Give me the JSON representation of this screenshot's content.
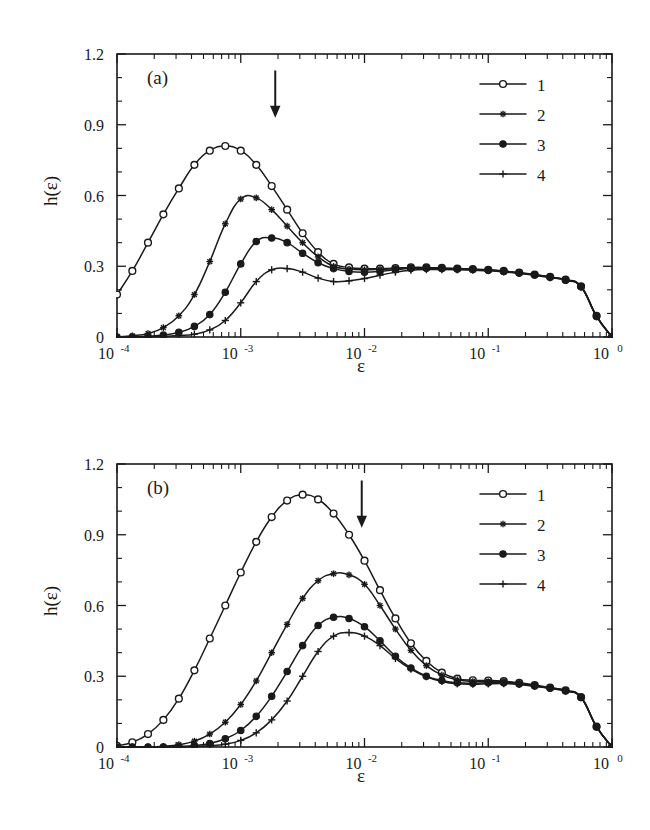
{
  "figure": {
    "background": "#ffffff",
    "ink_color": "#1a1a1a",
    "panels": [
      "a",
      "b"
    ]
  },
  "panel_a": {
    "tag": "(a)",
    "ylabel": "h(ε)",
    "xlabel": "ε",
    "arrow_x": 0.0019,
    "legend_entries": [
      "1",
      "2",
      "3",
      "4"
    ]
  },
  "panel_b": {
    "tag": "(b)",
    "ylabel": "h(ε)",
    "xlabel": "ε",
    "arrow_x": 0.0095,
    "legend_entries": [
      "1",
      "2",
      "3",
      "4"
    ]
  },
  "axes": {
    "y_ticks": [
      "0",
      "0.3",
      "0.6",
      "0.9",
      "1.2"
    ],
    "y_tick_values": [
      0,
      0.3,
      0.6,
      0.9,
      1.2
    ],
    "ylim": [
      0,
      1.2
    ],
    "x_tick_mantissa": [
      "10",
      "10",
      "10",
      "10",
      "10"
    ],
    "x_tick_exponents": [
      "-4",
      "-3",
      "-2",
      "-1",
      "0"
    ],
    "x_tick_values": [
      0.0001,
      0.001,
      0.01,
      0.1,
      1
    ],
    "xlim": [
      0.0001,
      1
    ],
    "x_scale": "log",
    "grid": false
  },
  "chart_data": [
    {
      "type": "line",
      "panel": "a",
      "title": "(a)",
      "xlabel": "ε",
      "ylabel": "h(ε)",
      "xscale": "log",
      "xlim": [
        0.0001,
        1
      ],
      "ylim": [
        0,
        1.2
      ],
      "grid": false,
      "legend_position": "top-right",
      "annotations": [
        {
          "type": "arrow",
          "x": 0.0019,
          "y_from": 1.13,
          "y_to": 0.93,
          "direction": "down"
        }
      ],
      "series": [
        {
          "name": "1",
          "marker": "open-circle",
          "x": [
            0.0001,
            0.000133,
            0.000178,
            0.000237,
            0.000316,
            0.000422,
            0.000562,
            0.00075,
            0.001,
            0.001334,
            0.001778,
            0.002371,
            0.003162,
            0.004217,
            0.005623,
            0.0075,
            0.01,
            0.01334,
            0.01778,
            0.02371,
            0.03162,
            0.04217,
            0.05623,
            0.075,
            0.1,
            0.1334,
            0.1778,
            0.2371,
            0.3162,
            0.4217,
            0.5623,
            0.75,
            1.0
          ],
          "y": [
            0.18,
            0.28,
            0.4,
            0.52,
            0.63,
            0.73,
            0.79,
            0.81,
            0.79,
            0.73,
            0.64,
            0.54,
            0.44,
            0.36,
            0.31,
            0.295,
            0.29,
            0.29,
            0.292,
            0.295,
            0.295,
            0.293,
            0.29,
            0.288,
            0.285,
            0.28,
            0.273,
            0.265,
            0.255,
            0.243,
            0.215,
            0.09,
            0.0
          ]
        },
        {
          "name": "2",
          "marker": "asterisk",
          "x": [
            0.0001,
            0.000133,
            0.000178,
            0.000237,
            0.000316,
            0.000422,
            0.000562,
            0.00075,
            0.001,
            0.001334,
            0.001778,
            0.002371,
            0.003162,
            0.004217,
            0.005623,
            0.0075,
            0.01,
            0.01334,
            0.01778,
            0.02371,
            0.03162,
            0.04217,
            0.05623,
            0.075,
            0.1,
            0.1334,
            0.1778,
            0.2371,
            0.3162,
            0.4217,
            0.5623,
            0.75,
            1.0
          ],
          "y": [
            0.0,
            0.005,
            0.015,
            0.04,
            0.09,
            0.18,
            0.32,
            0.48,
            0.585,
            0.59,
            0.54,
            0.47,
            0.4,
            0.34,
            0.3,
            0.288,
            0.285,
            0.287,
            0.29,
            0.293,
            0.293,
            0.291,
            0.289,
            0.287,
            0.284,
            0.279,
            0.272,
            0.264,
            0.254,
            0.242,
            0.214,
            0.088,
            0.0
          ]
        },
        {
          "name": "3",
          "marker": "filled-circle",
          "x": [
            0.0001,
            0.000133,
            0.000178,
            0.000237,
            0.000316,
            0.000422,
            0.000562,
            0.00075,
            0.001,
            0.001334,
            0.001778,
            0.002371,
            0.003162,
            0.004217,
            0.005623,
            0.0075,
            0.01,
            0.01334,
            0.01778,
            0.02371,
            0.03162,
            0.04217,
            0.05623,
            0.075,
            0.1,
            0.1334,
            0.1778,
            0.2371,
            0.3162,
            0.4217,
            0.5623,
            0.75,
            1.0
          ],
          "y": [
            0.0,
            0.0,
            0.003,
            0.008,
            0.02,
            0.045,
            0.095,
            0.19,
            0.31,
            0.405,
            0.42,
            0.4,
            0.355,
            0.315,
            0.29,
            0.278,
            0.275,
            0.278,
            0.285,
            0.29,
            0.291,
            0.29,
            0.288,
            0.286,
            0.283,
            0.278,
            0.271,
            0.263,
            0.253,
            0.241,
            0.213,
            0.087,
            0.0
          ]
        },
        {
          "name": "4",
          "marker": "plus",
          "x": [
            0.0001,
            0.000133,
            0.000178,
            0.000237,
            0.000316,
            0.000422,
            0.000562,
            0.00075,
            0.001,
            0.001334,
            0.001778,
            0.002371,
            0.003162,
            0.004217,
            0.005623,
            0.0075,
            0.01,
            0.01334,
            0.01778,
            0.02371,
            0.03162,
            0.04217,
            0.05623,
            0.075,
            0.1,
            0.1334,
            0.1778,
            0.2371,
            0.3162,
            0.4217,
            0.5623,
            0.75,
            1.0
          ],
          "y": [
            0.0,
            0.0,
            0.0,
            0.002,
            0.006,
            0.012,
            0.03,
            0.07,
            0.145,
            0.235,
            0.285,
            0.29,
            0.275,
            0.25,
            0.235,
            0.238,
            0.248,
            0.262,
            0.275,
            0.283,
            0.286,
            0.286,
            0.285,
            0.283,
            0.281,
            0.276,
            0.27,
            0.262,
            0.252,
            0.24,
            0.212,
            0.086,
            0.0
          ]
        }
      ]
    },
    {
      "type": "line",
      "panel": "b",
      "title": "(b)",
      "xlabel": "ε",
      "ylabel": "h(ε)",
      "xscale": "log",
      "xlim": [
        0.0001,
        1
      ],
      "ylim": [
        0,
        1.2
      ],
      "grid": false,
      "legend_position": "top-right",
      "annotations": [
        {
          "type": "arrow",
          "x": 0.0095,
          "y_from": 1.13,
          "y_to": 0.93,
          "direction": "down"
        }
      ],
      "series": [
        {
          "name": "1",
          "marker": "open-circle",
          "x": [
            0.0001,
            0.000133,
            0.000178,
            0.000237,
            0.000316,
            0.000422,
            0.000562,
            0.00075,
            0.001,
            0.001334,
            0.001778,
            0.002371,
            0.003162,
            0.004217,
            0.005623,
            0.0075,
            0.01,
            0.01334,
            0.01778,
            0.02371,
            0.03162,
            0.04217,
            0.05623,
            0.075,
            0.1,
            0.1334,
            0.1778,
            0.2371,
            0.3162,
            0.4217,
            0.5623,
            0.75,
            1.0
          ],
          "y": [
            0.005,
            0.02,
            0.055,
            0.115,
            0.205,
            0.325,
            0.46,
            0.6,
            0.74,
            0.87,
            0.975,
            1.045,
            1.07,
            1.05,
            0.99,
            0.9,
            0.79,
            0.665,
            0.545,
            0.44,
            0.365,
            0.315,
            0.29,
            0.283,
            0.282,
            0.279,
            0.272,
            0.263,
            0.252,
            0.24,
            0.212,
            0.087,
            0.0
          ]
        },
        {
          "name": "2",
          "marker": "asterisk",
          "x": [
            0.0001,
            0.000133,
            0.000178,
            0.000237,
            0.000316,
            0.000422,
            0.000562,
            0.00075,
            0.001,
            0.001334,
            0.001778,
            0.002371,
            0.003162,
            0.004217,
            0.005623,
            0.0075,
            0.01,
            0.01334,
            0.01778,
            0.02371,
            0.03162,
            0.04217,
            0.05623,
            0.075,
            0.1,
            0.1334,
            0.1778,
            0.2371,
            0.3162,
            0.4217,
            0.5623,
            0.75,
            1.0
          ],
          "y": [
            0.0,
            0.0,
            0.0,
            0.003,
            0.01,
            0.025,
            0.055,
            0.105,
            0.18,
            0.28,
            0.4,
            0.52,
            0.63,
            0.705,
            0.735,
            0.73,
            0.69,
            0.6,
            0.5,
            0.41,
            0.345,
            0.305,
            0.285,
            0.278,
            0.278,
            0.276,
            0.27,
            0.261,
            0.251,
            0.239,
            0.211,
            0.086,
            0.0
          ]
        },
        {
          "name": "3",
          "marker": "filled-circle",
          "x": [
            0.0001,
            0.000133,
            0.000178,
            0.000237,
            0.000316,
            0.000422,
            0.000562,
            0.00075,
            0.001,
            0.001334,
            0.001778,
            0.002371,
            0.003162,
            0.004217,
            0.005623,
            0.0075,
            0.01,
            0.01334,
            0.01778,
            0.02371,
            0.03162,
            0.04217,
            0.05623,
            0.075,
            0.1,
            0.1334,
            0.1778,
            0.2371,
            0.3162,
            0.4217,
            0.5623,
            0.75,
            1.0
          ],
          "y": [
            0.0,
            0.0,
            0.0,
            0.0,
            0.002,
            0.006,
            0.015,
            0.035,
            0.07,
            0.13,
            0.215,
            0.32,
            0.43,
            0.515,
            0.55,
            0.545,
            0.51,
            0.45,
            0.385,
            0.335,
            0.3,
            0.282,
            0.272,
            0.27,
            0.272,
            0.272,
            0.267,
            0.259,
            0.249,
            0.238,
            0.21,
            0.085,
            0.0
          ]
        },
        {
          "name": "4",
          "marker": "plus",
          "x": [
            0.0001,
            0.000133,
            0.000178,
            0.000237,
            0.000316,
            0.000422,
            0.000562,
            0.00075,
            0.001,
            0.001334,
            0.001778,
            0.002371,
            0.003162,
            0.004217,
            0.005623,
            0.0075,
            0.01,
            0.01334,
            0.01778,
            0.02371,
            0.03162,
            0.04217,
            0.05623,
            0.075,
            0.1,
            0.1334,
            0.1778,
            0.2371,
            0.3162,
            0.4217,
            0.5623,
            0.75,
            1.0
          ],
          "y": [
            0.0,
            0.0,
            0.0,
            0.0,
            0.0,
            0.002,
            0.005,
            0.012,
            0.028,
            0.06,
            0.115,
            0.195,
            0.3,
            0.405,
            0.47,
            0.485,
            0.47,
            0.43,
            0.375,
            0.33,
            0.298,
            0.278,
            0.268,
            0.266,
            0.268,
            0.269,
            0.265,
            0.257,
            0.248,
            0.237,
            0.209,
            0.084,
            0.0
          ]
        }
      ]
    }
  ]
}
